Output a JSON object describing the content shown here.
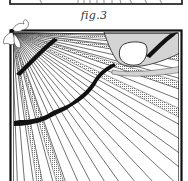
{
  "figure": {
    "caption": "fig.3",
    "colors": {
      "ink": "#111111",
      "hatch": "#555555",
      "thumb_shade": "#d4d4d4",
      "nail": "#ffffff",
      "paper": "#ffffff"
    },
    "elements": {
      "previous_figure_edge": "bottom border of preceding figure",
      "frame": "double-line rectangular border",
      "corner_ornament": "leaf sprig at top-left corner",
      "radial_lines": "lines fanning out from top-left corner",
      "vein_upper": "short dark band near top-left",
      "vein_main": "long dark wavy band from thumb to left edge",
      "thumb": "shaded thumb with white nail pressing from top right"
    }
  }
}
